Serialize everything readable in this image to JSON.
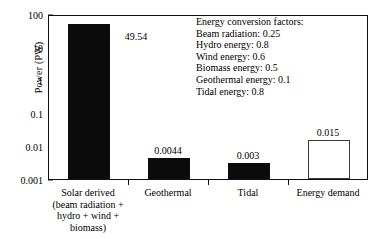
{
  "chart_data": {
    "type": "bar",
    "title": "",
    "xlabel": "",
    "ylabel": "Power (PW)",
    "yscale": "log",
    "ylim": [
      0.001,
      100
    ],
    "ytick_labels": [
      "100",
      "10",
      "1",
      "0.1",
      "0.01",
      "0.001"
    ],
    "ytick_values": [
      100,
      10,
      1,
      0.1,
      0.01,
      0.001
    ],
    "grid": false,
    "legend": "none",
    "categories": [
      "Solar derived\n(beam radiation +\nhydro + wind +\nbiomass)",
      "Geothermal",
      "Tidal",
      "Energy demand"
    ],
    "category_lines": [
      [
        "Solar derived",
        "(beam radiation +",
        "hydro + wind +",
        "biomass)"
      ],
      [
        "Geothermal"
      ],
      [
        "Tidal"
      ],
      [
        "Energy demand"
      ]
    ],
    "values": [
      49.54,
      0.0044,
      0.003,
      0.015
    ],
    "value_labels": [
      "49.54",
      "0.0044",
      "0.003",
      "0.015"
    ],
    "bar_styles": [
      "filled",
      "filled",
      "filled",
      "hollow"
    ],
    "colors": {
      "filled": "#0b0b0b",
      "hollow_edge": "#3b3b3b",
      "hollow_face": "#ffffff"
    },
    "annotations": {
      "title": "Energy conversion factors:",
      "lines": [
        "Energy conversion factors:",
        "Beam radiation: 0.25",
        "Hydro energy: 0.8",
        "Wind energy: 0.6",
        "Biomass energy: 0.5",
        "Geothermal energy: 0.1",
        "Tidal energy: 0.8"
      ],
      "factors": [
        {
          "name": "Beam radiation",
          "value": 0.25
        },
        {
          "name": "Hydro energy",
          "value": 0.8
        },
        {
          "name": "Wind energy",
          "value": 0.6
        },
        {
          "name": "Biomass energy",
          "value": 0.5
        },
        {
          "name": "Geothermal energy",
          "value": 0.1
        },
        {
          "name": "Tidal energy",
          "value": 0.8
        }
      ]
    }
  }
}
